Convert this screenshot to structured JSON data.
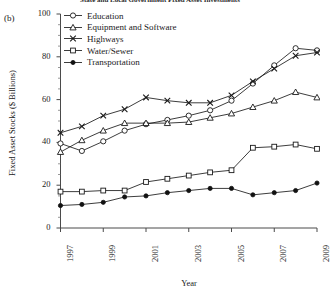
{
  "figure": {
    "cut_title": "State and Local Government Fixed Asset Investments",
    "panel_label": "(b)"
  },
  "chart_data": {
    "type": "line",
    "title": "State and Local Government Fixed Asset Investments",
    "xlabel": "Year",
    "ylabel": "Fixed Asset Stocks ($ Billions)",
    "xlim": [
      1997,
      2009
    ],
    "ylim": [
      0,
      100
    ],
    "grid": false,
    "legend_position": "top-left-inside",
    "x": [
      1997,
      1998,
      1999,
      2000,
      2001,
      2002,
      2003,
      2004,
      2005,
      2006,
      2007,
      2008,
      2009
    ],
    "ytick_labels": [
      "0",
      "20",
      "40",
      "60",
      "80",
      "100"
    ],
    "ytick_values": [
      0,
      20,
      40,
      60,
      80,
      100
    ],
    "yminor_step": 5,
    "xtick_labels": [
      "1997",
      "1999",
      "2001",
      "2003",
      "2005",
      "2007",
      "2009"
    ],
    "xtick_values": [
      1997,
      1999,
      2001,
      2003,
      2005,
      2007,
      2009
    ],
    "series": [
      {
        "name": "Education",
        "marker": "circle",
        "values": [
          39.5,
          36.0,
          40.5,
          45.5,
          48.5,
          50.5,
          52.5,
          55.0,
          59.5,
          67.5,
          76.0,
          84.0,
          83.0
        ]
      },
      {
        "name": "Equipment and Software",
        "marker": "triangle",
        "values": [
          35.5,
          41.0,
          45.5,
          49.0,
          49.0,
          49.0,
          49.5,
          51.5,
          53.5,
          56.5,
          59.5,
          63.5,
          61.0
        ]
      },
      {
        "name": "Highways",
        "marker": "x",
        "values": [
          44.5,
          47.5,
          52.5,
          55.5,
          61.0,
          59.5,
          58.5,
          58.5,
          62.0,
          68.5,
          74.5,
          80.5,
          82.0
        ]
      },
      {
        "name": "Water/Sewer",
        "marker": "square",
        "values": [
          17.0,
          17.0,
          17.5,
          17.5,
          21.5,
          23.0,
          24.5,
          26.0,
          27.0,
          37.5,
          38.0,
          39.0,
          37.0
        ]
      },
      {
        "name": "Transportation",
        "marker": "filled-circle",
        "values": [
          10.5,
          11.0,
          12.0,
          14.5,
          15.0,
          16.5,
          17.5,
          18.5,
          18.5,
          15.5,
          16.5,
          17.5,
          21.0
        ]
      }
    ]
  },
  "legend": {
    "items": [
      {
        "label": "Education",
        "marker": "circle"
      },
      {
        "label": "Equipment and Software",
        "marker": "triangle"
      },
      {
        "label": "Highways",
        "marker": "x"
      },
      {
        "label": "Water/Sewer",
        "marker": "square"
      },
      {
        "label": "Transportation",
        "marker": "filled-circle"
      }
    ]
  }
}
